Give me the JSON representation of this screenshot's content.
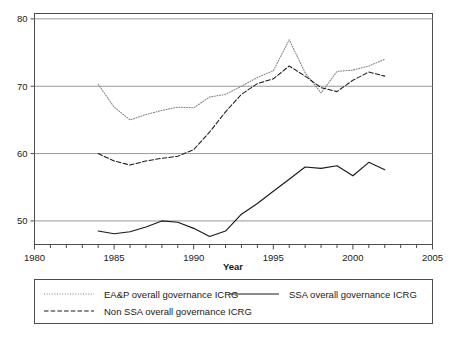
{
  "chart_data": {
    "type": "line",
    "title": "",
    "xlabel": "Year",
    "ylabel": "",
    "xlim": [
      1980,
      2005
    ],
    "ylim": [
      46.5,
      80.8
    ],
    "grid": "horizontal",
    "legend_position": "below-axes",
    "xticks": [
      1980,
      1985,
      1990,
      1995,
      2000,
      2005
    ],
    "xtick_labels": [
      "1980",
      "1985",
      "1990",
      "1995",
      "2000",
      "2005"
    ],
    "xminor_ticks": [
      1981,
      1982,
      1983,
      1984,
      1986,
      1987,
      1988,
      1989,
      1991,
      1992,
      1993,
      1994,
      1996,
      1997,
      1998,
      1999,
      2001,
      2002,
      2003,
      2004
    ],
    "yticks": [
      50,
      60,
      70,
      80
    ],
    "ytick_labels": [
      "50",
      "60",
      "70",
      "80"
    ],
    "x": [
      1984,
      1985,
      1986,
      1987,
      1988,
      1989,
      1990,
      1991,
      1992,
      1993,
      1994,
      1995,
      1996,
      1997,
      1998,
      1999,
      2000,
      2001,
      2002
    ],
    "series": [
      {
        "name": "EA&P overall governance ICRG",
        "style": "dotted",
        "color": "#808080",
        "values": [
          70.3,
          66.9,
          65.0,
          65.8,
          66.4,
          66.9,
          66.8,
          68.4,
          68.8,
          70.0,
          71.3,
          72.3,
          76.9,
          72.0,
          69.0,
          72.2,
          72.4,
          73.0,
          74.0
        ]
      },
      {
        "name": "SSA overall governance ICRG",
        "style": "solid",
        "color": "#1a1a1a",
        "values": [
          48.5,
          48.1,
          48.4,
          49.1,
          50.0,
          49.8,
          48.9,
          47.7,
          48.5,
          51.0,
          52.6,
          54.4,
          56.2,
          58.0,
          57.8,
          58.2,
          56.7,
          58.7,
          57.6
        ]
      },
      {
        "name": "Non SSA overall governance ICRG",
        "style": "dashed",
        "color": "#1a1a1a",
        "values": [
          60.0,
          58.9,
          58.3,
          58.9,
          59.3,
          59.6,
          60.6,
          63.2,
          66.2,
          68.8,
          70.4,
          71.1,
          73.0,
          71.5,
          69.8,
          69.2,
          70.9,
          72.1,
          71.5
        ]
      }
    ],
    "legend": [
      {
        "label": "EA&P overall governance ICRG",
        "style": "dotted",
        "color": "#808080"
      },
      {
        "label": "SSA overall governance ICRG",
        "style": "solid",
        "color": "#1a1a1a"
      },
      {
        "label": "Non SSA overall governance ICRG",
        "style": "dashed",
        "color": "#1a1a1a"
      }
    ]
  },
  "axis": {
    "x_title": "Year"
  },
  "caption": {
    "text": ""
  }
}
